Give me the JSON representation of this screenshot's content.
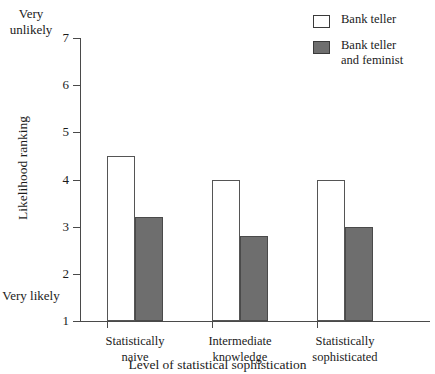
{
  "chart_data": {
    "type": "bar",
    "title": "",
    "xlabel": "Level of statistical sophistication",
    "ylabel": "Likelihood ranking",
    "categories": [
      "Statistically\nnaive",
      "Intermediate\nknowledge",
      "Statistically\nsophisticated"
    ],
    "series": [
      {
        "name": "Bank teller",
        "values": [
          4.5,
          4.0,
          4.0
        ],
        "color": "#ffffff",
        "border": "#555555"
      },
      {
        "name": "Bank teller\nand feminist",
        "values": [
          3.2,
          2.8,
          3.0
        ],
        "color": "#6e6e6e",
        "border": "#4a4a4a"
      }
    ],
    "ylim": [
      1,
      7
    ],
    "yticks": [
      7,
      6,
      5,
      4,
      3,
      2,
      1
    ],
    "ytick_labels": [
      "7",
      "6",
      "5",
      "4",
      "3",
      "2",
      "1"
    ],
    "y_axis_top_annotation": "Very\nunlikely",
    "y_axis_bottom_annotation": "Very\nlikely",
    "grid": false,
    "legend_position": "top-right"
  },
  "legend": {
    "items": [
      {
        "label": "Bank teller",
        "swatch": "open-square-icon"
      },
      {
        "label": "Bank teller\nand feminist",
        "swatch": "filled-square-icon"
      }
    ]
  }
}
